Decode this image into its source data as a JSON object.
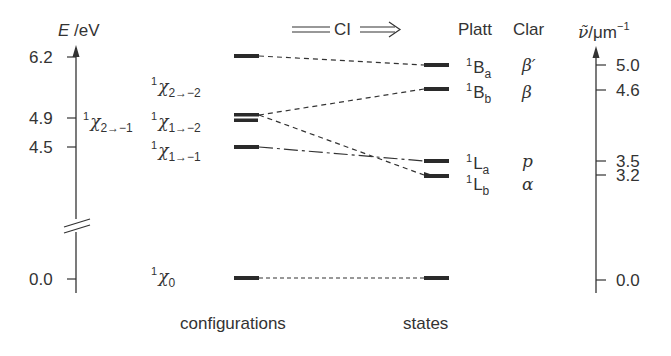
{
  "left_axis": {
    "label_var": "E",
    "label_unit": " /eV",
    "ticks": [
      {
        "label": "6.2",
        "value": 6.2
      },
      {
        "label": "4.9",
        "value": 4.9
      },
      {
        "label": "4.5",
        "value": 4.5
      },
      {
        "label": "0.0",
        "value": 0.0
      }
    ]
  },
  "right_axis": {
    "label_var": "ν̃",
    "label_unit": "/μm",
    "label_exp": "−1",
    "ticks": [
      {
        "label": "5.0",
        "value": 5.0
      },
      {
        "label": "4.6",
        "value": 4.6
      },
      {
        "label": "3.5",
        "value": 3.5
      },
      {
        "label": "3.2",
        "value": 3.2
      },
      {
        "label": "0.0",
        "value": 0.0
      }
    ]
  },
  "header": {
    "ci_label": "CI",
    "platt_header": "Platt",
    "clar_header": "Clar"
  },
  "configurations": [
    {
      "mult": "1",
      "symbol": "χ",
      "sub": "2→−2",
      "energy_eV": 6.2
    },
    {
      "mult": "1",
      "symbol": "χ",
      "sub": "2→−1",
      "energy_eV": 4.9
    },
    {
      "mult": "1",
      "symbol": "χ",
      "sub": "1→−2",
      "energy_eV": 4.9
    },
    {
      "mult": "1",
      "symbol": "χ",
      "sub": "1→−1",
      "energy_eV": 4.5
    },
    {
      "mult": "1",
      "symbol": "χ",
      "sub": "0",
      "energy_eV": 0.0
    }
  ],
  "states": [
    {
      "mult": "1",
      "platt": "B",
      "platt_sub": "a",
      "clar": "β′",
      "wavenumber": 5.0
    },
    {
      "mult": "1",
      "platt": "B",
      "platt_sub": "b",
      "clar": "β",
      "wavenumber": 4.6
    },
    {
      "mult": "1",
      "platt": "L",
      "platt_sub": "a",
      "clar": "p",
      "wavenumber": 3.5
    },
    {
      "mult": "1",
      "platt": "L",
      "platt_sub": "b",
      "clar": "α",
      "wavenumber": 3.2
    }
  ],
  "footer": {
    "configurations_label": "configurations",
    "states_label": "states"
  },
  "colors": {
    "ink": "#333333",
    "bar": "#2a2a2a"
  }
}
